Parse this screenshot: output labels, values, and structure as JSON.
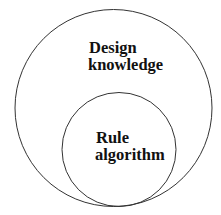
{
  "diagram": {
    "type": "nested-circles",
    "outer": {
      "label_lines": [
        "Design",
        "knowledge"
      ]
    },
    "inner": {
      "label_lines": [
        "Rule",
        "algorithm"
      ]
    },
    "stroke_color": "#333333",
    "background": "#ffffff"
  }
}
